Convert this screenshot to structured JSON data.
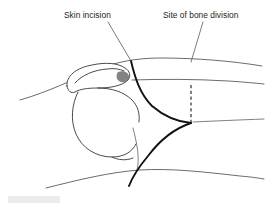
{
  "figure": {
    "type": "medical-line-illustration",
    "background_color": "#ffffff",
    "width": 266,
    "height": 208
  },
  "annotations": [
    {
      "id": "skin-incision",
      "label": "Skin incision",
      "text_x": 64,
      "text_y": 18,
      "leader": {
        "x1": 108,
        "y1": 22,
        "x2": 131,
        "y2": 61
      },
      "color": "#231f20"
    },
    {
      "id": "site-of-bone-division",
      "label": "Site of bone division",
      "text_x": 163,
      "text_y": 18,
      "leader": {
        "x1": 203,
        "y1": 22,
        "x2": 191,
        "y2": 62
      },
      "color": "#231f20"
    }
  ],
  "markings": {
    "incision_label": "skin incision curve",
    "incision_color": "#111111",
    "incision_stroke_width": 1.9,
    "division_label": "bone division dashed line",
    "division_color": "#1a1a1a",
    "division_dash": "3.2 2.6",
    "division_x": 191,
    "division_y_top": 85,
    "division_y_bottom": 122
  },
  "anatomy": {
    "arm_contour_color": "#3a3a3a",
    "bone_outline_color": "#2b2b2b",
    "shading_color": "#6d6d6d",
    "parts": [
      "upper arm contour",
      "shoulder contour",
      "clavicle",
      "acromion",
      "humeral head",
      "torso contour"
    ]
  },
  "watermark": {
    "present": true,
    "color": "#ebebeb",
    "x": 8,
    "y": 196,
    "width": 52,
    "height": 7
  }
}
